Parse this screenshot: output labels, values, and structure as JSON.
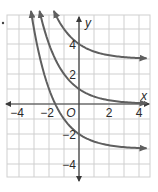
{
  "chart_data": {
    "type": "line",
    "title": "",
    "xlabel": "x",
    "ylabel": "y",
    "origin_label": "O",
    "xlim": [
      -4.8,
      4.7
    ],
    "ylim": [
      -4.9,
      6.0
    ],
    "grid": true,
    "grid_step": 1,
    "x_ticks": [
      -4,
      -2,
      2,
      4
    ],
    "y_ticks": [
      4,
      2,
      -2,
      -4
    ],
    "x_tick_labels": [
      "−4",
      "−2",
      "2",
      "4"
    ],
    "y_tick_labels": [
      "4",
      "2",
      "−2",
      "−4"
    ],
    "series": [
      {
        "name": "y = (1/2)^x + 3",
        "base": 0.5,
        "shift": 3,
        "asymptote": 3,
        "y_intercept": 4,
        "x": [
          -1.7,
          -1,
          0,
          1,
          2,
          3,
          4.6
        ],
        "values": [
          6.25,
          5,
          4,
          3.5,
          3.25,
          3.125,
          3.04
        ]
      },
      {
        "name": "y = (1/2)^x",
        "base": 0.5,
        "shift": 0,
        "asymptote": 0,
        "y_intercept": 1,
        "x": [
          -2.6,
          -2,
          -1,
          0,
          1,
          2,
          3,
          4.6
        ],
        "values": [
          6.06,
          4,
          2,
          1,
          0.5,
          0.25,
          0.125,
          0.04
        ]
      },
      {
        "name": "y = (1/2)^x - 3",
        "base": 0.5,
        "shift": -3,
        "asymptote": -3,
        "y_intercept": -2,
        "x": [
          -3.2,
          -3,
          -2,
          -1,
          0,
          1,
          2,
          3,
          4.6
        ],
        "values": [
          6.19,
          5,
          1,
          -1,
          -2,
          -2.5,
          -2.75,
          -2.875,
          -2.96
        ]
      }
    ]
  },
  "colors": {
    "curve": "#5f5f5f",
    "axis": "#3a3a3a",
    "grid": "#cfcfcf",
    "text": "#2a2a2a"
  }
}
